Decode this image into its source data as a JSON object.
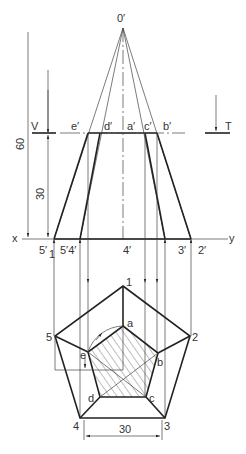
{
  "diagram": {
    "apex_label": "0′",
    "section_plane": {
      "left_label": "V",
      "right_label": "T"
    },
    "front_view_section_points": [
      "e′",
      "d′",
      "a′",
      "c′",
      "b′"
    ],
    "ground_line": {
      "left_label": "x",
      "right_label": "y"
    },
    "base_points_front": [
      "5′₁",
      "5′",
      "4′",
      "4′",
      "3′",
      "2′"
    ],
    "base_label_5_1": "5′",
    "base_label_5_1_sub": "1",
    "base_label_54": "5′4′",
    "base_label_4": "4′",
    "base_label_3": "3′",
    "base_label_2": "2′",
    "top_view_outer": [
      "1",
      "2",
      "3",
      "4",
      "5"
    ],
    "top_view_inner": [
      "a",
      "b",
      "c",
      "d",
      "e"
    ],
    "dimensions": {
      "height": "60",
      "section_height": "30",
      "base_edge": "30"
    }
  }
}
